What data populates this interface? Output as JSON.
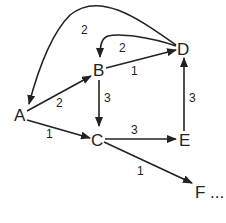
{
  "diagram": {
    "type": "weighted directed graph",
    "nodes": [
      {
        "id": "A",
        "label": "A"
      },
      {
        "id": "B",
        "label": "B"
      },
      {
        "id": "C",
        "label": "C"
      },
      {
        "id": "D",
        "label": "D"
      },
      {
        "id": "E",
        "label": "E"
      },
      {
        "id": "F",
        "label": "F ..."
      }
    ],
    "edges": [
      {
        "from": "A",
        "to": "B",
        "weight": "2"
      },
      {
        "from": "A",
        "to": "C",
        "weight": "1"
      },
      {
        "from": "B",
        "to": "D",
        "weight": "1"
      },
      {
        "from": "D",
        "to": "B",
        "weight": "2"
      },
      {
        "from": "D",
        "to": "A",
        "weight": "2"
      },
      {
        "from": "B",
        "to": "C",
        "weight": "3"
      },
      {
        "from": "C",
        "to": "E",
        "weight": "3"
      },
      {
        "from": "E",
        "to": "D",
        "weight": "3"
      },
      {
        "from": "C",
        "to": "F",
        "weight": "1"
      }
    ]
  }
}
